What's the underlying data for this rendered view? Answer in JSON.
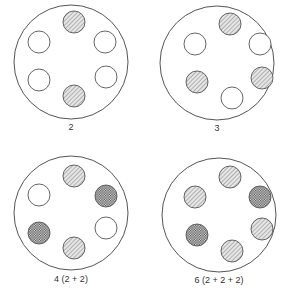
{
  "colors": {
    "stroke": "#555555",
    "hatch": "#777777",
    "cross": "#444444",
    "empty": "#ffffff"
  },
  "panels": [
    {
      "label": "2",
      "slots": [
        "hatched",
        "empty",
        "empty",
        "empty",
        "empty",
        "hatched"
      ]
    },
    {
      "label": "3",
      "slots": [
        "hatched",
        "empty",
        "empty",
        "hatched",
        "hatched",
        "empty"
      ]
    },
    {
      "label": "4 (2 + 2)",
      "slots": [
        "hatched",
        "empty",
        "crosshatched",
        "crosshatched",
        "empty",
        "hatched"
      ]
    },
    {
      "label": "6 (2 + 2 + 2)",
      "slots": [
        "hatched",
        "hatched",
        "crosshatched",
        "crosshatched",
        "hatched",
        "hatched"
      ]
    }
  ],
  "slot_order": [
    "top",
    "upper-left",
    "upper-right",
    "lower-left",
    "lower-right",
    "bottom"
  ]
}
